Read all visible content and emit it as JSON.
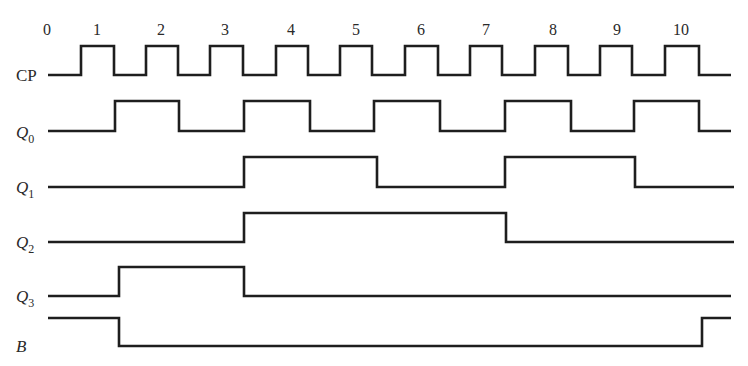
{
  "clock_ticks": {
    "labels": [
      "0",
      "1",
      "2",
      "3",
      "4",
      "5",
      "6",
      "7",
      "8",
      "9",
      "10"
    ],
    "x": [
      47,
      97,
      161,
      225,
      291,
      356,
      421,
      486,
      553,
      617,
      681
    ],
    "y": 35
  },
  "signals": [
    {
      "id": "CP",
      "label": "CP",
      "subscript": "",
      "italic": false,
      "label_x": 16,
      "label_y": 81,
      "low_y": 75,
      "high_y": 46,
      "start_x": 48,
      "end_x": 731,
      "initial": 0,
      "edges": [
        81,
        114,
        146,
        178,
        210,
        243,
        276,
        308,
        340,
        372,
        405,
        438,
        470,
        502,
        535,
        568,
        600,
        632,
        665,
        699
      ]
    },
    {
      "id": "Q0",
      "label": "Q",
      "subscript": "0",
      "italic": true,
      "label_x": 16,
      "label_y": 138,
      "low_y": 131,
      "high_y": 101,
      "start_x": 48,
      "end_x": 731,
      "initial": 0,
      "edges": [
        115,
        179,
        244,
        310,
        374,
        440,
        505,
        571,
        634,
        699
      ]
    },
    {
      "id": "Q1",
      "label": "Q",
      "subscript": "1",
      "italic": true,
      "label_x": 16,
      "label_y": 193,
      "low_y": 187,
      "high_y": 157,
      "start_x": 48,
      "end_x": 734,
      "initial": 0,
      "edges": [
        244,
        377,
        505,
        635
      ]
    },
    {
      "id": "Q2",
      "label": "Q",
      "subscript": "2",
      "italic": true,
      "label_x": 16,
      "label_y": 248,
      "low_y": 242,
      "high_y": 213,
      "start_x": 48,
      "end_x": 734,
      "initial": 0,
      "edges": [
        244,
        506
      ]
    },
    {
      "id": "Q3",
      "label": "Q",
      "subscript": "3",
      "italic": true,
      "label_x": 16,
      "label_y": 302,
      "low_y": 296,
      "high_y": 267,
      "start_x": 48,
      "end_x": 731,
      "initial": 0,
      "edges": [
        119,
        244
      ]
    },
    {
      "id": "B",
      "label": "B",
      "subscript": "",
      "italic": true,
      "label_x": 16,
      "label_y": 352,
      "low_y": 346,
      "high_y": 318,
      "start_x": 48,
      "end_x": 731,
      "initial": 1,
      "edges": [
        119,
        702
      ]
    }
  ],
  "colors": {
    "line": "#1e1e1e",
    "text": "#2a2a2a",
    "background": "#ffffff"
  }
}
